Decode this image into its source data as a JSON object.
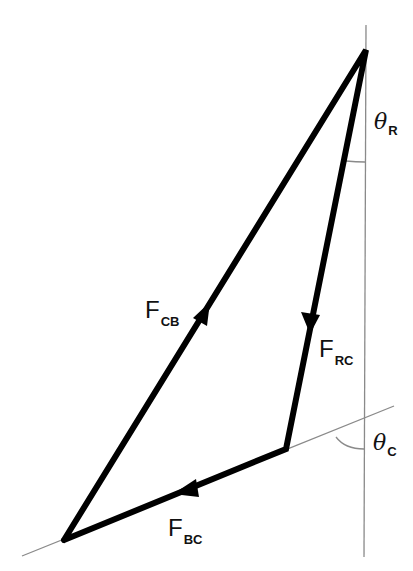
{
  "diagram": {
    "title": "",
    "colors": {
      "vector": "#000000",
      "reference_line": "#8a8a8a",
      "background": "#ffffff"
    },
    "vectors": [
      {
        "id": "F_CB",
        "symbol": "F",
        "subscript": "CB",
        "from": "lower-left vertex",
        "to": "top vertex"
      },
      {
        "id": "F_RC",
        "symbol": "F",
        "subscript": "RC",
        "from": "top vertex",
        "to": "C vertex"
      },
      {
        "id": "F_BC",
        "symbol": "F",
        "subscript": "BC",
        "from": "C vertex",
        "to": "lower-left vertex"
      }
    ],
    "angles": [
      {
        "id": "theta_R",
        "symbol": "θ",
        "subscript": "R",
        "between": "vertical reference line and F_RC"
      },
      {
        "id": "theta_C",
        "symbol": "θ",
        "subscript": "C",
        "between": "vertical reference line and inclined line"
      }
    ],
    "labels": {
      "f_cb": {
        "main": "F",
        "sub": "CB"
      },
      "f_rc": {
        "main": "F",
        "sub": "RC"
      },
      "f_bc": {
        "main": "F",
        "sub": "BC"
      },
      "theta_r": {
        "main": "θ",
        "sub": "R"
      },
      "theta_c": {
        "main": "θ",
        "sub": "C"
      }
    }
  }
}
